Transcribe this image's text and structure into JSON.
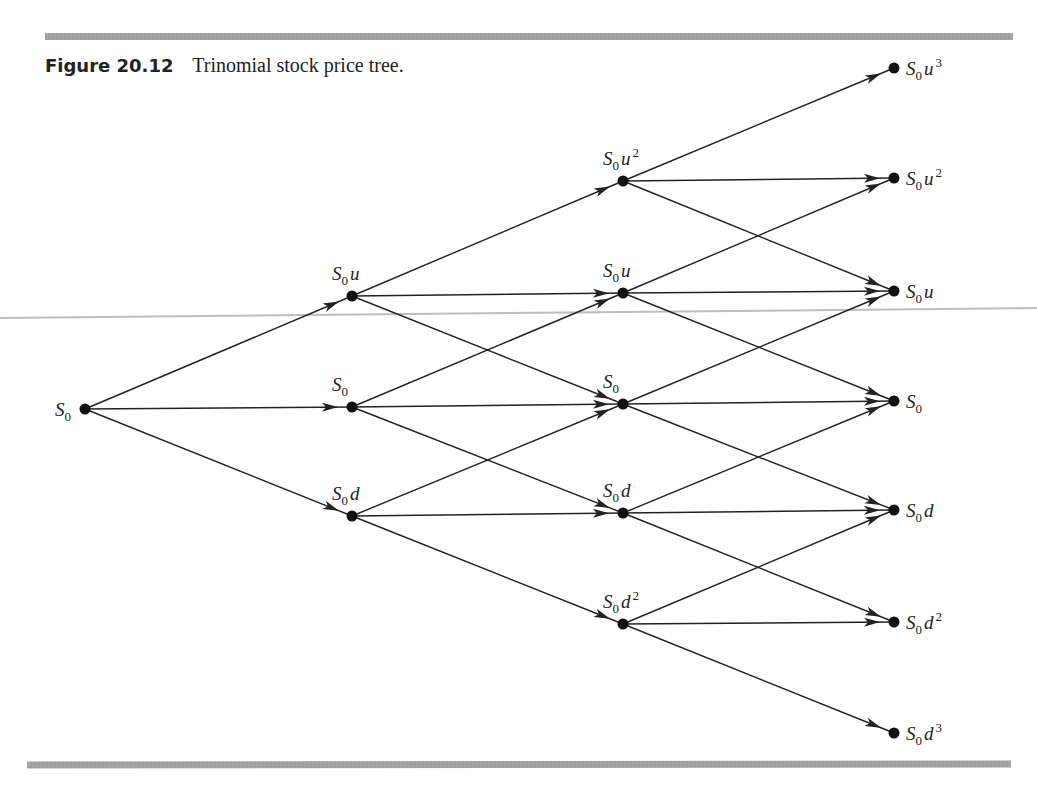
{
  "figure": {
    "number": "Figure 20.12",
    "title": "Trinomial stock price tree."
  },
  "colors": {
    "ink": "#222222",
    "rule": "#a0a0a0",
    "background": "#ffffff"
  },
  "tree": {
    "type": "trinomial",
    "steps": 3,
    "columns": [
      {
        "x": 85,
        "nodes": [
          {
            "id": "n0_0",
            "y": 409,
            "base": "S",
            "sub": "0",
            "var": "",
            "exp": "",
            "label_pos": "left"
          }
        ]
      },
      {
        "x": 352,
        "nodes": [
          {
            "id": "n1_1",
            "y": 296,
            "base": "S",
            "sub": "0",
            "var": "u",
            "exp": "",
            "label_pos": "above"
          },
          {
            "id": "n1_0",
            "y": 407,
            "base": "S",
            "sub": "0",
            "var": "",
            "exp": "",
            "label_pos": "above"
          },
          {
            "id": "n1_-1",
            "y": 516,
            "base": "S",
            "sub": "0",
            "var": "d",
            "exp": "",
            "label_pos": "above"
          }
        ]
      },
      {
        "x": 623,
        "nodes": [
          {
            "id": "n2_2",
            "y": 181,
            "base": "S",
            "sub": "0",
            "var": "u",
            "exp": "2",
            "label_pos": "above"
          },
          {
            "id": "n2_1",
            "y": 293,
            "base": "S",
            "sub": "0",
            "var": "u",
            "exp": "",
            "label_pos": "above"
          },
          {
            "id": "n2_0",
            "y": 404,
            "base": "S",
            "sub": "0",
            "var": "",
            "exp": "",
            "label_pos": "above"
          },
          {
            "id": "n2_-1",
            "y": 513,
            "base": "S",
            "sub": "0",
            "var": "d",
            "exp": "",
            "label_pos": "above"
          },
          {
            "id": "n2_-2",
            "y": 624,
            "base": "S",
            "sub": "0",
            "var": "d",
            "exp": "2",
            "label_pos": "above"
          }
        ]
      },
      {
        "x": 894,
        "nodes": [
          {
            "id": "n3_3",
            "y": 68,
            "base": "S",
            "sub": "0",
            "var": "u",
            "exp": "3",
            "label_pos": "right"
          },
          {
            "id": "n3_2",
            "y": 178,
            "base": "S",
            "sub": "0",
            "var": "u",
            "exp": "2",
            "label_pos": "right"
          },
          {
            "id": "n3_1",
            "y": 291,
            "base": "S",
            "sub": "0",
            "var": "u",
            "exp": "",
            "label_pos": "right"
          },
          {
            "id": "n3_0",
            "y": 401,
            "base": "S",
            "sub": "0",
            "var": "",
            "exp": "",
            "label_pos": "right"
          },
          {
            "id": "n3_-1",
            "y": 510,
            "base": "S",
            "sub": "0",
            "var": "d",
            "exp": "",
            "label_pos": "right"
          },
          {
            "id": "n3_-2",
            "y": 622,
            "base": "S",
            "sub": "0",
            "var": "d",
            "exp": "2",
            "label_pos": "right"
          },
          {
            "id": "n3_-3",
            "y": 733,
            "base": "S",
            "sub": "0",
            "var": "d",
            "exp": "3",
            "label_pos": "right"
          }
        ]
      }
    ],
    "labels": {
      "n0_0": "S0",
      "n1_1": "S0u",
      "n1_0": "S0",
      "n1_-1": "S0d",
      "n2_2": "S0u^2",
      "n2_1": "S0u",
      "n2_0": "S0",
      "n2_-1": "S0d",
      "n2_-2": "S0d^2",
      "n3_3": "S0u^3",
      "n3_2": "S0u^2",
      "n3_1": "S0u",
      "n3_0": "S0",
      "n3_-1": "S0d",
      "n3_-2": "S0d^2",
      "n3_-3": "S0d^3"
    }
  }
}
